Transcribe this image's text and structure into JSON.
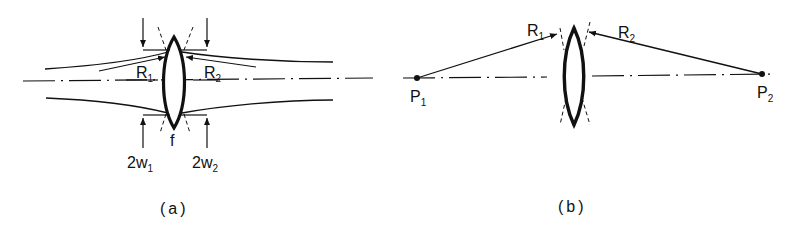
{
  "figure": {
    "panels": [
      {
        "id": "a",
        "caption": "(a)",
        "description": "Gaussian beam focused through a thin lens of focal length f; beam waists 2w1 and 2w2 with wavefront radii R1 and R2",
        "labels": {
          "R1": {
            "main": "R",
            "sub": "1"
          },
          "R2": {
            "main": "R",
            "sub": "2"
          },
          "f": "f",
          "w1": {
            "prefix": "2w",
            "sub": "1"
          },
          "w2": {
            "prefix": "2w",
            "sub": "2"
          }
        }
      },
      {
        "id": "b",
        "caption": "(b)",
        "description": "Point source imaging through thin lens; radii R1 and R2 from points P1 and P2",
        "labels": {
          "R1": {
            "main": "R",
            "sub": "1"
          },
          "R2": {
            "main": "R",
            "sub": "2"
          },
          "P1": {
            "main": "P",
            "sub": "1"
          },
          "P2": {
            "main": "P",
            "sub": "2"
          }
        }
      }
    ],
    "colors": {
      "ink": "#111111",
      "background": "#ffffff"
    }
  }
}
